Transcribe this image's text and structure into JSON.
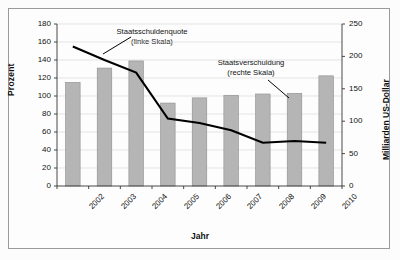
{
  "chart_data": {
    "type": "bar",
    "title": "",
    "xlabel": "Jahr",
    "ylabel": "Prozent",
    "ylabel_right": "Milliarden US-Dollar",
    "categories": [
      "2002",
      "2003",
      "2004",
      "2005",
      "2006",
      "2007",
      "2008",
      "2009",
      "2010"
    ],
    "ylim": [
      0,
      180
    ],
    "yticks": [
      0,
      20,
      40,
      60,
      80,
      100,
      120,
      140,
      160,
      180
    ],
    "ylim_right": [
      0,
      250
    ],
    "yticks_right": [
      0,
      50,
      100,
      150,
      200,
      250
    ],
    "grid": true,
    "legend": "annotations",
    "series": [
      {
        "name": "Staatsverschuldung",
        "type": "bar",
        "axis": "right",
        "unit": "Milliarden US-Dollar",
        "color": "#b5b5b5",
        "values": [
          160,
          182,
          193,
          128,
          136,
          140,
          142,
          143,
          170
        ]
      },
      {
        "name": "Staatsschuldenquote",
        "type": "line",
        "axis": "left",
        "unit": "Prozent",
        "color": "#000000",
        "values": [
          155,
          140,
          126,
          75,
          70,
          62,
          48,
          50,
          48
        ]
      }
    ],
    "annotations": [
      {
        "name": "Staatsschuldenquote",
        "line1": "Staatsschuldenquote",
        "line2": "(linke Skala)"
      },
      {
        "name": "Staatsverschuldung",
        "line1": "Staatsverschuldung",
        "line2": "(rechte Skala)"
      }
    ]
  }
}
